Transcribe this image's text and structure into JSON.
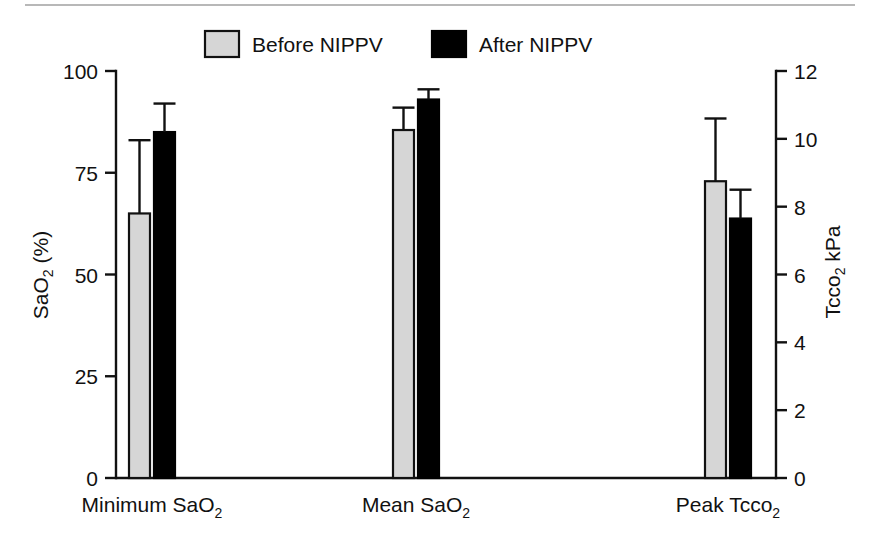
{
  "chart_data": {
    "type": "bar",
    "title": "",
    "subtitle": "",
    "categories": [
      "Minimum SaO2",
      "Mean SaO2",
      "Peak Tcco2"
    ],
    "category_labels": [
      {
        "base": "Minimum SaO",
        "sub": "2"
      },
      {
        "base": "Mean SaO",
        "sub": "2"
      },
      {
        "base": "Peak Tcco",
        "sub": "2"
      }
    ],
    "series": [
      {
        "name": "Before NIPPV",
        "color": "#d6d6d6",
        "values": [
          65,
          85.5,
          8.75
        ],
        "errors_upper": [
          83,
          91,
          10.6
        ],
        "axis": [
          "left",
          "left",
          "right"
        ]
      },
      {
        "name": "After NIPPV",
        "color": "#000000",
        "values": [
          85,
          93,
          7.65
        ],
        "errors_upper": [
          92,
          95.5,
          8.5
        ],
        "axis": [
          "left",
          "left",
          "right"
        ]
      }
    ],
    "left_axis": {
      "label_base": "SaO",
      "label_sub": "2",
      "label_suffix": " (%)",
      "ticks": [
        0,
        25,
        50,
        75,
        100
      ],
      "ylim": [
        0,
        100
      ]
    },
    "right_axis": {
      "label_base": "Tcco",
      "label_sub": "2",
      "label_suffix": " kPa",
      "ticks": [
        0,
        2,
        4,
        6,
        8,
        10,
        12
      ],
      "ylim": [
        0,
        12
      ]
    },
    "legend": {
      "position": "top-center",
      "entries": [
        {
          "label": "Before NIPPV",
          "swatch": "light-gray"
        },
        {
          "label": "After NIPPV",
          "swatch": "black"
        }
      ]
    },
    "grid": false,
    "error_bar_style": "upper-only-with-cap"
  },
  "colors": {
    "before_fill": "#d6d6d6",
    "after_fill": "#000000",
    "axis": "#111111",
    "rule": "#b8b8b8",
    "background": "#ffffff"
  }
}
